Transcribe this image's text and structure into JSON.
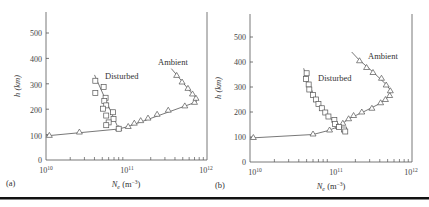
{
  "figure": {
    "rule_color": "#111111"
  },
  "chart_data": [
    {
      "type": "line",
      "panel_label": "(a)",
      "xlabel": "N_e (m^-3)",
      "ylabel": "h (km)",
      "xscale": "log",
      "xlim": [
        10000000000.0,
        1000000000000.0
      ],
      "ylim": [
        0,
        570
      ],
      "x_ticks": [
        "10^10",
        "10^11",
        "10^12"
      ],
      "y_ticks": [
        0,
        100,
        200,
        300,
        400,
        500
      ],
      "grid": false,
      "series": [
        {
          "name": "Ambient",
          "marker": "triangle",
          "points": [
            [
              11000000000.0,
              97
            ],
            [
              26000000000.0,
              110
            ],
            [
              80000000000.0,
              124
            ],
            [
              105000000000.0,
              132
            ],
            [
              125000000000.0,
              145
            ],
            [
              150000000000.0,
              155
            ],
            [
              185000000000.0,
              165
            ],
            [
              240000000000.0,
              180
            ],
            [
              330000000000.0,
              196
            ],
            [
              530000000000.0,
              213
            ],
            [
              700000000000.0,
              227
            ],
            [
              730000000000.0,
              243
            ],
            [
              660000000000.0,
              260
            ],
            [
              580000000000.0,
              282
            ],
            [
              490000000000.0,
              307
            ],
            [
              420000000000.0,
              333
            ]
          ],
          "line": [
            [
              10000000000.0,
              95
            ],
            [
              80000000000.0,
              122
            ],
            [
              105000000000.0,
              132
            ],
            [
              730000000000.0,
              228
            ],
            [
              750000000000.0,
              243
            ],
            [
              650000000000.0,
              262
            ],
            [
              420000000000.0,
              335
            ],
            [
              360000000000.0,
              360
            ]
          ]
        },
        {
          "name": "Disturbed",
          "marker": "square",
          "points": [
            [
              41000000000.0,
              312
            ],
            [
              41000000000.0,
              264
            ],
            [
              52000000000.0,
              287
            ],
            [
              55000000000.0,
              245
            ],
            [
              53000000000.0,
              232
            ],
            [
              56000000000.0,
              215
            ],
            [
              51000000000.0,
              202
            ],
            [
              68000000000.0,
              188
            ],
            [
              56000000000.0,
              175
            ],
            [
              69000000000.0,
              162
            ],
            [
              60000000000.0,
              148
            ],
            [
              56000000000.0,
              137
            ],
            [
              80000000000.0,
              123
            ]
          ],
          "line": [
            [
              40000000000.0,
              335
            ],
            [
              80000000000.0,
              122
            ]
          ]
        }
      ],
      "annotations": [
        {
          "text": "Disturbed",
          "x": 65000000000.0,
          "y": 325
        },
        {
          "text": "Ambient",
          "x": 360000000000.0,
          "y": 378
        }
      ]
    },
    {
      "type": "line",
      "panel_label": "(b)",
      "xlabel": "N_e (m^-3)",
      "ylabel": "h (km)",
      "xscale": "log",
      "xlim": [
        10000000000.0,
        1000000000000.0
      ],
      "ylim": [
        0,
        570
      ],
      "x_ticks": [
        "10^10",
        "10^11",
        "10^12"
      ],
      "y_ticks": [
        0,
        100,
        200,
        300,
        400,
        500
      ],
      "grid": false,
      "series": [
        {
          "name": "Ambient",
          "marker": "triangle",
          "points": [
            [
              11000000000.0,
              98
            ],
            [
              60000000000.0,
              112
            ],
            [
              96000000000.0,
              128
            ],
            [
              123000000000.0,
              142
            ],
            [
              140000000000.0,
              155
            ],
            [
              165000000000.0,
              173
            ],
            [
              190000000000.0,
              186
            ],
            [
              240000000000.0,
              200
            ],
            [
              320000000000.0,
              215
            ],
            [
              410000000000.0,
              237
            ],
            [
              470000000000.0,
              250
            ],
            [
              530000000000.0,
              266
            ],
            [
              540000000000.0,
              285
            ],
            [
              480000000000.0,
              308
            ],
            [
              420000000000.0,
              335
            ],
            [
              330000000000.0,
              358
            ],
            [
              275000000000.0,
              378
            ],
            [
              225000000000.0,
              405
            ]
          ],
          "line": [
            [
              10000000000.0,
              96
            ],
            [
              60000000000.0,
              110
            ],
            [
              90000000000.0,
              125
            ],
            [
              120000000000.0,
              140
            ],
            [
              170000000000.0,
              175
            ],
            [
              250000000000.0,
              200
            ],
            [
              380000000000.0,
              230
            ],
            [
              510000000000.0,
              260
            ],
            [
              550000000000.0,
              285
            ],
            [
              480000000000.0,
              310
            ],
            [
              330000000000.0,
              360
            ],
            [
              220000000000.0,
              410
            ],
            [
              180000000000.0,
              440
            ]
          ]
        },
        {
          "name": "Disturbed",
          "marker": "square",
          "points": [
            [
              50000000000.0,
              355
            ],
            [
              49000000000.0,
              332
            ],
            [
              53000000000.0,
              310
            ],
            [
              54000000000.0,
              290
            ],
            [
              60000000000.0,
              268
            ],
            [
              65000000000.0,
              250
            ],
            [
              70000000000.0,
              232
            ],
            [
              77000000000.0,
              215
            ],
            [
              85000000000.0,
              198
            ],
            [
              93000000000.0,
              182
            ],
            [
              110000000000.0,
              168
            ],
            [
              112000000000.0,
              152
            ],
            [
              126000000000.0,
              140
            ],
            [
              145000000000.0,
              130
            ],
            [
              150000000000.0,
              122
            ]
          ],
          "line": [
            [
              46000000000.0,
              375
            ],
            [
              50000000000.0,
              335
            ],
            [
              60000000000.0,
              275
            ],
            [
              80000000000.0,
              210
            ],
            [
              105000000000.0,
              165
            ],
            [
              130000000000.0,
              140
            ],
            [
              150000000000.0,
              122
            ]
          ]
        }
      ],
      "annotations": [
        {
          "text": "Disturbed",
          "x": 62000000000.0,
          "y": 335
        },
        {
          "text": "Ambient",
          "x": 300000000000.0,
          "y": 430
        }
      ]
    }
  ],
  "panels": [
    {
      "label": "(a)",
      "ylabel": "h (km)",
      "xlabel": "N",
      "xlabel_sub": "e",
      "xlabel_unit": " (m",
      "xlabel_exp": "−3",
      "xlabel_close": ")",
      "x_tick_labels": [
        {
          "base": "10",
          "exp": "10"
        },
        {
          "base": "10",
          "exp": "11"
        },
        {
          "base": "10",
          "exp": "12"
        }
      ],
      "y_tick_labels": [
        "0",
        "100",
        "200",
        "300",
        "400",
        "500"
      ],
      "disturbed_label": "Disturbed",
      "ambient_label": "Ambient"
    },
    {
      "label": "(b)",
      "ylabel": "h (km)",
      "xlabel": "N",
      "xlabel_sub": "e",
      "xlabel_unit": " (m",
      "xlabel_exp": "−3",
      "xlabel_close": ")",
      "x_tick_labels": [
        {
          "base": "10",
          "exp": "10"
        },
        {
          "base": "10",
          "exp": "11"
        },
        {
          "base": "10",
          "exp": "12"
        }
      ],
      "y_tick_labels": [
        "0",
        "100",
        "200",
        "300",
        "400",
        "500"
      ],
      "disturbed_label": "Disturbed",
      "ambient_label": "Ambient"
    }
  ]
}
